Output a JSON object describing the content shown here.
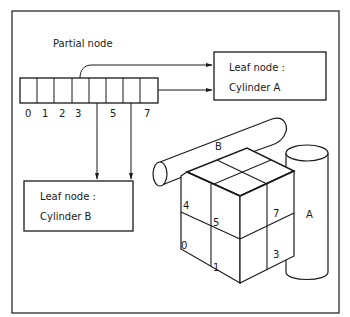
{
  "diagram": {
    "title": "Partial node",
    "array": {
      "cell_count": 8,
      "index_labels": [
        "0",
        "1",
        "2",
        "3",
        "",
        "5",
        "",
        "7"
      ]
    },
    "leaf_a": {
      "line1": "Leaf node :",
      "line2": "Cylinder A"
    },
    "leaf_b": {
      "line1": "Leaf node :",
      "line2": "Cylinder B"
    },
    "cylinder_labels": {
      "a": "A",
      "b": "B"
    },
    "octant_labels": {
      "o4": "4",
      "o5": "5",
      "o7": "7",
      "o0": "0",
      "o1": "1",
      "o3": "3"
    },
    "colors": {
      "ink": "#1a1a1a",
      "paper": "#ffffff"
    }
  }
}
